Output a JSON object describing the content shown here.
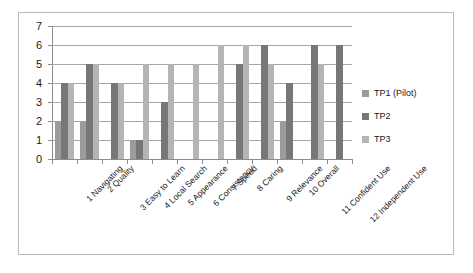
{
  "chart_data": {
    "type": "bar",
    "title": "",
    "xlabel": "",
    "ylabel": "",
    "ylim": [
      0,
      7
    ],
    "ytick_labels": [
      "0",
      "1",
      "2",
      "3",
      "4",
      "5",
      "6",
      "7"
    ],
    "grid": true,
    "legend_position": "right",
    "categories": [
      "1 Navigating",
      "2 Quality",
      "3 Easy to Learn",
      "4 Local Search",
      "5 Appearance",
      "6 Consistency",
      "7 Speed",
      "8 Caring",
      "9 Relevance",
      "10 Overall",
      "11 Confident Use",
      "12 Independent Use"
    ],
    "series": [
      {
        "name": "TP1 (Pilot)",
        "color": "#9b9b9b",
        "values": [
          2,
          2,
          0,
          1,
          0,
          0,
          0,
          0,
          0,
          2,
          0,
          0
        ]
      },
      {
        "name": "TP2",
        "color": "#777777",
        "values": [
          4,
          5,
          4,
          1,
          3,
          0,
          0,
          5,
          6,
          4,
          6,
          6
        ]
      },
      {
        "name": "TP3",
        "color": "#b5b5b5",
        "values": [
          4,
          5,
          4,
          5,
          5,
          5,
          6,
          6,
          5,
          0,
          5,
          0
        ]
      }
    ]
  },
  "legend": {
    "items": [
      {
        "label": "TP1 (Pilot)"
      },
      {
        "label": "TP2"
      },
      {
        "label": "TP3"
      }
    ]
  }
}
